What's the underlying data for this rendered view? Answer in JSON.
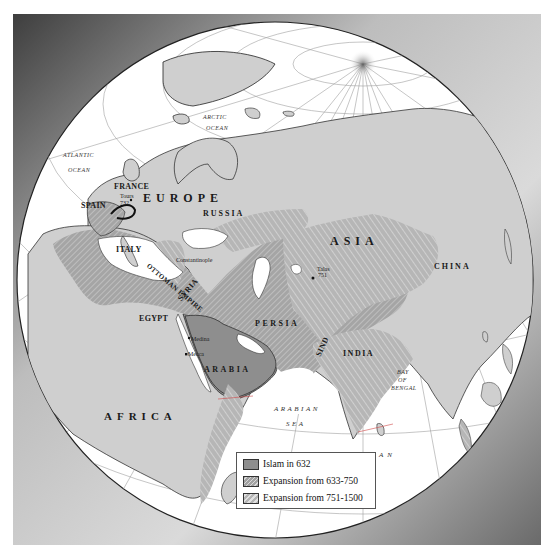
{
  "map": {
    "projection": "orthographic globe",
    "colors": {
      "ocean": "#ffffff",
      "land": "#cfcfcf",
      "islam_632": "#8e8e8e",
      "expansion_633_750": "#a5a5a5",
      "expansion_751_1500": "#b4b4b4",
      "graticule": "#9a9a9a",
      "frame_dark": "#4a4a4a",
      "frame_light": "#e6e6e6"
    },
    "labels": {
      "regions": {
        "europe": "EUROPE",
        "asia": "ASIA",
        "africa": "AFRICA",
        "russia": "RUSSIA",
        "persia": "PERSIA",
        "arabia": "ARABIA",
        "china": "CHINA",
        "india": "INDIA"
      },
      "countries": {
        "france": "FRANCE",
        "spain": "SPAIN",
        "italy": "ITALY",
        "ottoman_empire": "OTTOMAN EMPIRE",
        "syria": "SYRIA",
        "egypt": "EGYPT",
        "sind": "SIND"
      },
      "oceans": {
        "arctic_1": "ARCTIC",
        "arctic_2": "OCEAN",
        "atlantic_1": "ATLANTIC",
        "atlantic_2": "OCEAN",
        "arabian_1": "ARABIAN",
        "arabian_2": "SEA",
        "indian": "INDIAN   OCEAN",
        "bay_1": "BAY",
        "bay_2": "OF",
        "bay_3": "BENGAL"
      },
      "cities": {
        "tours": "Tours",
        "tours_year": "732",
        "constantinople": "Constantinople",
        "talas": "Talas",
        "talas_year": "751",
        "medina": "Medina",
        "mecca": "Mecca"
      }
    }
  },
  "legend": {
    "items": [
      {
        "label": "Islam in 632",
        "color": "#8e8e8e",
        "pattern": "solid"
      },
      {
        "label": "Expansion from 633-750",
        "color": "#a5a5a5",
        "pattern": "fine-hatch"
      },
      {
        "label": "Expansion from 751-1500",
        "color": "#b4b4b4",
        "pattern": "hatch"
      }
    ]
  }
}
